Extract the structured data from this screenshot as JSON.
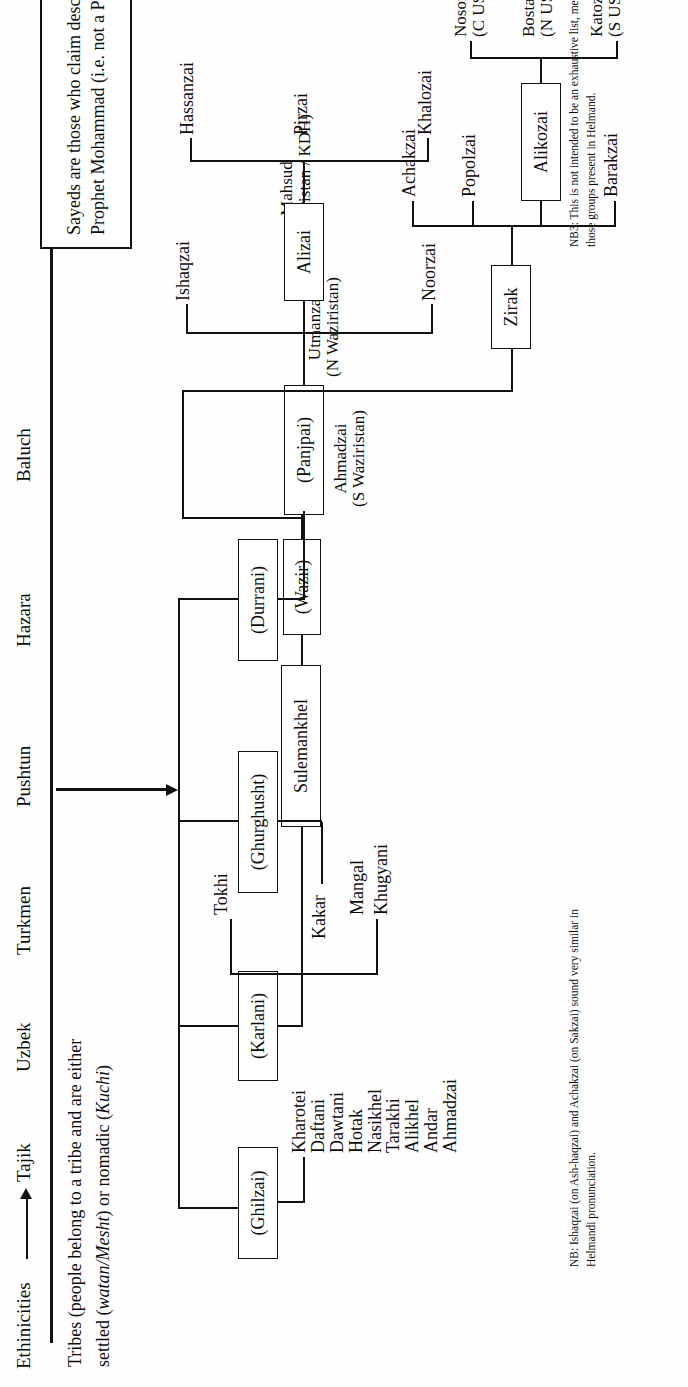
{
  "axis": {
    "ethnicities_label": "Ethinicities",
    "arrow_icon": "right-arrow-icon",
    "ethnicities": [
      "Tajik",
      "Uzbek",
      "Turkmen",
      "Pushtun",
      "Hazara",
      "Baluch"
    ],
    "tribes_caption_line1": "Tribes (people belong to a tribe and are either",
    "tribes_caption_line2_pre": "settled (",
    "tribes_caption_watan": "watan/Mesht",
    "tribes_caption_mid": ") or nomadic (",
    "tribes_caption_kuchi": "Kuchi",
    "tribes_caption_end": ")"
  },
  "tree": {
    "root_marker": "pushtun-branch-arrow",
    "confederations": [
      {
        "id": "ghilzai",
        "label": "(Ghilzai)"
      },
      {
        "id": "karlani",
        "label": "(Karlani)"
      },
      {
        "id": "ghurghusht",
        "label": "(Ghurghusht)"
      },
      {
        "id": "durrani",
        "label": "(Durrani)"
      }
    ],
    "ghilzai_children": [
      "Kharotei",
      "Daftani",
      "Dawtani",
      "Hotak",
      "Nasikhel",
      "Tarakhi",
      "Alikhel",
      "Andar",
      "Ahmadzai"
    ],
    "karlani_children_left": [
      "Mangal",
      "Khugyani"
    ],
    "karlani_children_right": [
      "Tokhi"
    ],
    "karlani_boxes": [
      {
        "id": "sulemankhel",
        "label": "Sulemankhel"
      },
      {
        "id": "wazir",
        "label": "(Wazir)"
      }
    ],
    "wazir_children": [
      {
        "name": "Ahmadzai",
        "note": "(S Waziristan)"
      },
      {
        "name": "Utmanzai",
        "note": "(N Waziristan)"
      },
      {
        "name": "Mahsud",
        "note": "(C Waziristan / KDH)"
      }
    ],
    "ghurghusht_children": [
      "Kakar"
    ],
    "durrani_boxes": [
      {
        "id": "panjpai",
        "label": "(Panjpai)"
      },
      {
        "id": "zirak",
        "label": "Zirak"
      }
    ],
    "panjpai_children": [
      "Noorzai",
      "Alizai",
      "Ishaqzai"
    ],
    "alizai_box": "Alizai",
    "alizai_children": [
      "Khalozai",
      "Pirzai",
      "Hassanzai"
    ],
    "zirak_children": [
      "Barakzai",
      "Alikozai",
      "Popolzai",
      "Achakzai"
    ],
    "alikozai_box": "Alikozai",
    "alikozai_children": [
      {
        "name": "Katozai",
        "note": "(S USV)"
      },
      {
        "name": "Bostanzai",
        "note": "(N USV)"
      },
      {
        "name": "Nosozai",
        "note": "(C USV)"
      }
    ]
  },
  "sayed_note": {
    "line1": "Sayeds are those who claim descent from the",
    "line2": "Prophet Mohammad (i.e. not a Pushtun tribe)"
  },
  "footnotes": {
    "nb3_line1": "NB3: This is not intended to be an exhaustive list, merely an aide memoir to",
    "nb3_line2": "those groups present in Helmand.",
    "nb_line1": "NB: Ishaqzai (on Ash-haqzai) and Achakzai (on Sakzai) sound very similar in",
    "nb_line2": "Helmandi pronunciation."
  },
  "colors": {
    "ink": "#111111",
    "paper": "#fefefe"
  }
}
